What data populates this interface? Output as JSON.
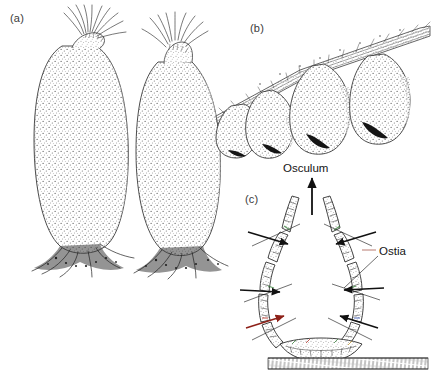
{
  "figure": {
    "background_color": "#ffffff",
    "ink_color": "#2b2b2b",
    "panels": [
      {
        "id": "a",
        "label": "(a)",
        "subject": "two elongate stipitate sponges with osculum bristle fringe and rooted basal tuft",
        "count": 2
      },
      {
        "id": "b",
        "label": "(b)",
        "subject": "four ovoid sponge bodies suspended from a fibrous stalk, each with a dark slit osculum",
        "count": 4
      },
      {
        "id": "c",
        "label": "(c)",
        "subject": "schematic cross-section of sponge body wall showing water flow",
        "count": 1
      }
    ]
  },
  "annotations": {
    "osculum": "Osculum",
    "ostia": "Ostia"
  },
  "caption": {
    "text": ""
  },
  "colors": {
    "accent_green": "#2f7d32",
    "accent_red": "#b02418",
    "accent_blue": "#2746a6",
    "stipple": "#555555",
    "outline": "#232323"
  }
}
